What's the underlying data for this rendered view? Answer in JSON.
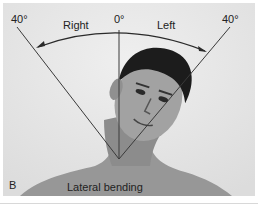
{
  "figure": {
    "panel_label": "B",
    "caption": "Lateral bending",
    "angles": {
      "left_max": "40°",
      "center": "0°",
      "right_max": "40°"
    },
    "directions": {
      "right": "Right",
      "left": "Left"
    }
  }
}
